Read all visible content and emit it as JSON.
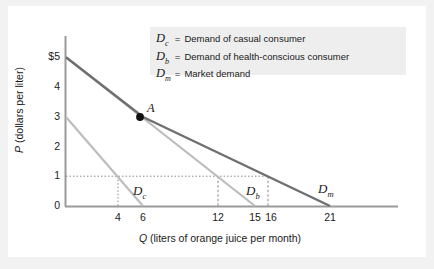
{
  "figure": {
    "background": "#f2f2f2",
    "panel": "#ffffff",
    "legend_bg": "#eeeeee"
  },
  "axes": {
    "y_title": "P (dollars per liter)",
    "y_title_italic": "P",
    "y_title_rest": " (dollars per liter)",
    "x_title": "Q (liters of orange juice per month)",
    "x_title_italic": "Q",
    "x_title_rest": " (liters of orange juice per month)"
  },
  "legend": {
    "rows": [
      {
        "symbol": "D",
        "sub": "c",
        "eq": "=",
        "text": "Demand of casual consumer"
      },
      {
        "symbol": "D",
        "sub": "b",
        "eq": "=",
        "text": "Demand of health-conscious consumer"
      },
      {
        "symbol": "D",
        "sub": "m",
        "eq": "=",
        "text": "Market demand"
      }
    ]
  },
  "annotations": {
    "point_a": "A",
    "curve_dc_sym": "D",
    "curve_dc_sub": "c",
    "curve_db_sym": "D",
    "curve_db_sub": "b",
    "curve_dm_sym": "D",
    "curve_dm_sub": "m"
  },
  "chart_data": {
    "type": "line",
    "title": "",
    "xlabel": "Q (liters of orange juice per month)",
    "ylabel": "P (dollars per liter)",
    "xlim": [
      0,
      25
    ],
    "ylim": [
      0,
      5.6
    ],
    "grid": false,
    "legend_position": "top-center",
    "y_ticks": [
      0,
      1,
      2,
      3,
      4,
      5
    ],
    "y_tick_labels": [
      "0",
      "1",
      "2",
      "3",
      "4",
      "$5"
    ],
    "x_ticks": [
      4,
      6,
      12,
      15,
      16,
      21
    ],
    "x_tick_labels": [
      "4",
      "6",
      "12",
      "15",
      "16",
      "21"
    ],
    "series": [
      {
        "name": "D_c",
        "label": "Demand of casual consumer",
        "color": "#b5b5b5",
        "width": 2,
        "points": [
          [
            0,
            3
          ],
          [
            6,
            0
          ]
        ],
        "intercept_p": 3,
        "intercept_q": 6
      },
      {
        "name": "D_b",
        "label": "Demand of health-conscious consumer",
        "color": "#b5b5b5",
        "width": 2,
        "points": [
          [
            0,
            5
          ],
          [
            15,
            0
          ]
        ],
        "intercept_p": 5,
        "intercept_q": 15
      },
      {
        "name": "D_m",
        "label": "Market demand",
        "color": "#6e6e6e",
        "width": 2.4,
        "points": [
          [
            0,
            5
          ],
          [
            6,
            3
          ],
          [
            21,
            0
          ]
        ],
        "kink_point": [
          6,
          3
        ],
        "intercept_p": 5,
        "intercept_q": 21
      }
    ],
    "markers": [
      {
        "label": "A",
        "x": 6,
        "y": 3,
        "color": "#111111"
      }
    ],
    "guides": {
      "horizontal": {
        "y": 1,
        "from_x": 0,
        "to_x": 16,
        "style": "dotted"
      },
      "verticals": [
        {
          "x": 4,
          "from_y": 0,
          "to_y": 1,
          "style": "dotted"
        },
        {
          "x": 12,
          "from_y": 0,
          "to_y": 1,
          "style": "dashed"
        },
        {
          "x": 16,
          "from_y": 0,
          "to_y": 1,
          "style": "dashed"
        }
      ]
    },
    "annotation_values": {
      "price_reference": 1,
      "q_casual_at_p1": 4,
      "q_health_at_p1": 12,
      "q_market_at_p1": 16
    }
  }
}
